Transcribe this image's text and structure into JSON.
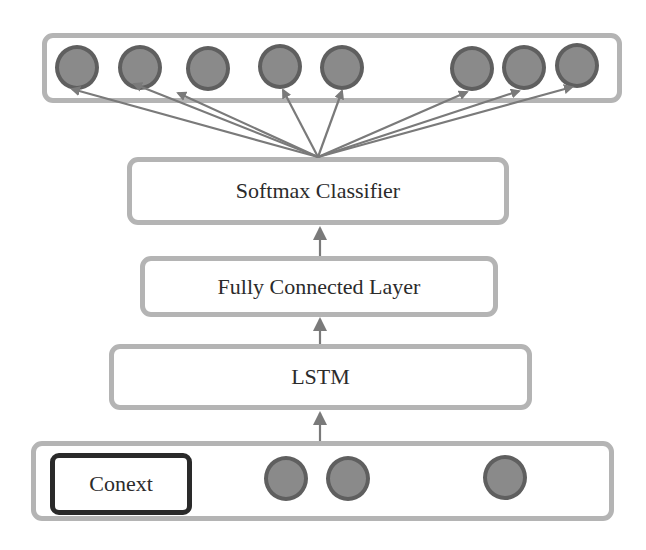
{
  "diagram": {
    "title": "",
    "colors": {
      "box_border": "#b4b4b4",
      "node_fill": "#8a8a8a",
      "node_border": "#5f5f5f",
      "arrow": "#7a7a7a",
      "context_border": "#2a2a2a",
      "text": "#2b2b2b"
    },
    "output_layer": {
      "label": "",
      "node_count": 8
    },
    "layers": [
      {
        "id": "softmax",
        "label": "Softmax Classifier"
      },
      {
        "id": "fully_connected",
        "label": "Fully Connected Layer"
      },
      {
        "id": "lstm",
        "label": "LSTM"
      }
    ],
    "input_layer": {
      "context_label": "Conext",
      "node_count": 3
    },
    "edges": [
      {
        "from": "softmax",
        "to": "output_nodes",
        "type": "fan-out",
        "count": 8
      },
      {
        "from": "fully_connected",
        "to": "softmax"
      },
      {
        "from": "lstm",
        "to": "fully_connected"
      },
      {
        "from": "input_layer",
        "to": "lstm"
      }
    ]
  }
}
